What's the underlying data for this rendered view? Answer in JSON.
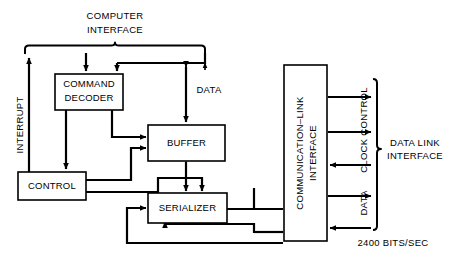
{
  "diagram": {
    "blocks": [
      {
        "id": "command_decoder",
        "label_line1": "COMMAND",
        "label_line2": "DECODER"
      },
      {
        "id": "control",
        "label_line1": "CONTROL"
      },
      {
        "id": "buffer",
        "label_line1": "BUFFER"
      },
      {
        "id": "serializer",
        "label_line1": "SERIALIZER"
      },
      {
        "id": "comm_link_interface",
        "label_line1": "COMMUNICATION–LINK",
        "label_line2": "INTERFACE"
      }
    ],
    "labels": {
      "computer_interface_line1": "COMPUTER",
      "computer_interface_line2": "INTERFACE",
      "interrupt": "INTERRUPT",
      "data_top": "DATA",
      "clock_control": "CLOCK CONTROL",
      "data_link_interface_line1": "DATA LINK",
      "data_link_interface_line2": "INTERFACE",
      "data_right": "DATA",
      "bit_rate": "2400 BITS/SEC"
    },
    "colors": {
      "ink": "#000000",
      "paper": "#ffffff"
    }
  }
}
